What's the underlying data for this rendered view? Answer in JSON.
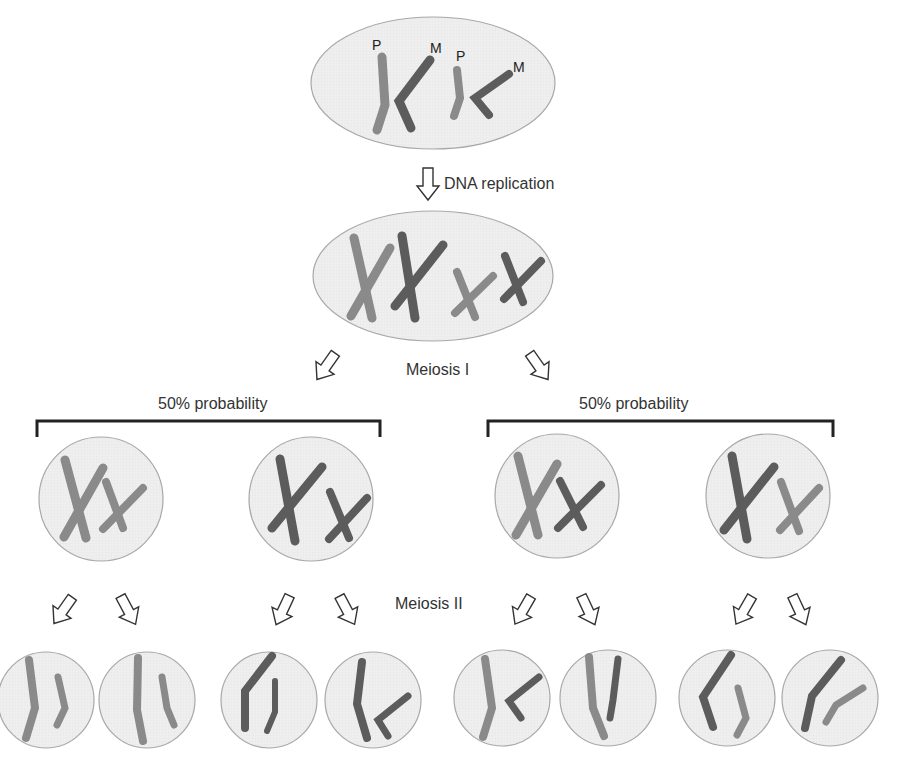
{
  "colors": {
    "paternal": "#8a8a8a",
    "maternal": "#5c5c5c",
    "cell_fill": "#ededed",
    "cell_border": "#a8a8a8",
    "bracket": "#222222",
    "text": "#333333"
  },
  "top_cell": {
    "labels": [
      "P",
      "M",
      "P",
      "M"
    ]
  },
  "steps": {
    "dna_replication": "DNA replication",
    "meiosis_1": "Meiosis I",
    "meiosis_2": "Meiosis II"
  },
  "branches": [
    {
      "label": "50% probability"
    },
    {
      "label": "50% probability"
    }
  ]
}
